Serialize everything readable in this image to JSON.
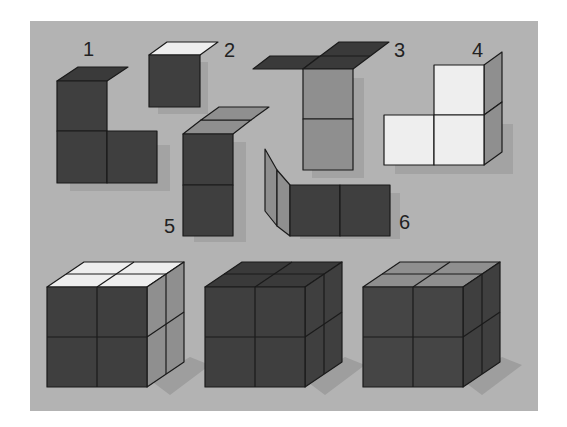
{
  "figure": {
    "panel_color": "#b3b3b3",
    "colors": {
      "dark": "#3f3f3f",
      "mid": "#8f8f8f",
      "light": "#eeeeee",
      "shadow": "#9e9e9e"
    },
    "pieces": [
      {
        "label": "1",
        "description": "L-shaped piece of three dark cubes, dark top"
      },
      {
        "label": "2",
        "description": "single dark cube with light top"
      },
      {
        "label": "3",
        "description": "two-cube gray column with dark top and dark flap"
      },
      {
        "label": "4",
        "description": "L-shaped piece of three light cubes with gray sides"
      },
      {
        "label": "5",
        "description": "two-cube dark column with gray top"
      },
      {
        "label": "6",
        "description": "two dark cubes with gray side flap"
      }
    ],
    "assembled_cubes": [
      {
        "name": "cube-a",
        "top": "light",
        "front": "dark",
        "side": "mid"
      },
      {
        "name": "cube-b",
        "top": "dark",
        "front": "dark",
        "side": "dark"
      },
      {
        "name": "cube-c",
        "top": "mid",
        "front": "dark",
        "side": "dark"
      }
    ]
  }
}
